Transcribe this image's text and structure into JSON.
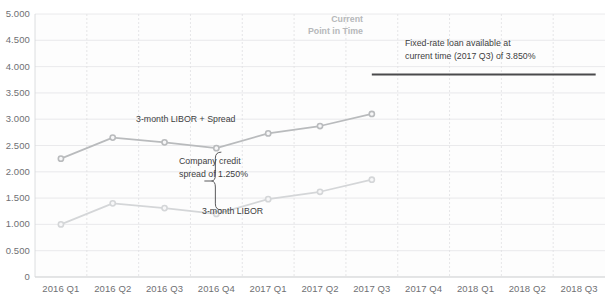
{
  "chart_data": {
    "type": "line",
    "title": "",
    "xlabel": "",
    "ylabel": "",
    "ylim": [
      0,
      5.0
    ],
    "yticks": [
      "0",
      "0.500",
      "1.000",
      "1.500",
      "2.000",
      "2.500",
      "3.000",
      "3.500",
      "4.000",
      "4.500",
      "5.000"
    ],
    "grid": true,
    "legend_position": "inline-annotations",
    "categories": [
      "2016 Q1",
      "2016 Q2",
      "2016 Q3",
      "2016 Q4",
      "2017 Q1",
      "2017 Q2",
      "2017 Q3",
      "2017 Q4",
      "2018 Q1",
      "2018 Q2",
      "2018 Q3"
    ],
    "series": [
      {
        "name": "3-month LIBOR + Spread",
        "color": "#b9bbbd",
        "values": [
          2.25,
          2.65,
          2.56,
          2.45,
          2.73,
          2.87,
          3.1,
          null,
          null,
          null,
          null
        ]
      },
      {
        "name": "3-month LIBOR",
        "color": "#d4d6d8",
        "values": [
          1.0,
          1.4,
          1.31,
          1.2,
          1.48,
          1.62,
          1.85,
          null,
          null,
          null,
          null
        ]
      },
      {
        "name": "Fixed-rate loan",
        "color": "#4a4a4c",
        "type": "hline",
        "value": 3.85,
        "from_category": "2017 Q3",
        "to_category": "2018 Q3"
      }
    ],
    "annotations": [
      {
        "name": "series-label-libor-spread",
        "text": "3-month LIBOR + Spread"
      },
      {
        "name": "series-label-libor",
        "text": "3-month LIBOR"
      },
      {
        "name": "credit-spread-label-line1",
        "text": "Company credit"
      },
      {
        "name": "credit-spread-label-line2",
        "text": "spread of 1.250%"
      },
      {
        "name": "current-point-line1",
        "text": "Current"
      },
      {
        "name": "current-point-line2",
        "text": "Point in Time"
      },
      {
        "name": "fixed-rate-label-line1",
        "text": "Fixed-rate loan available at"
      },
      {
        "name": "fixed-rate-label-line2",
        "text": "current time (2017 Q3) of 3.850%"
      }
    ],
    "spread_value": "1.250%",
    "fixed_rate_value": "3.850%",
    "current_point_category": "2017 Q3"
  }
}
